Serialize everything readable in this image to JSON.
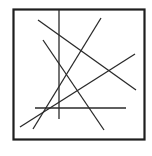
{
  "figure": {
    "line_color": "#2a2a2a",
    "frame_color": "#1e1e1e",
    "background_color": "#ffffff",
    "segment_count": 6,
    "segments": [
      {
        "id": "vertical-line",
        "orientation": "vertical"
      },
      {
        "id": "horizontal-line",
        "orientation": "horizontal"
      },
      {
        "id": "diagonal-line-a",
        "orientation": "descending"
      },
      {
        "id": "diagonal-line-b",
        "orientation": "ascending"
      },
      {
        "id": "diagonal-line-c",
        "orientation": "descending"
      },
      {
        "id": "diagonal-line-d",
        "orientation": "ascending"
      }
    ]
  }
}
